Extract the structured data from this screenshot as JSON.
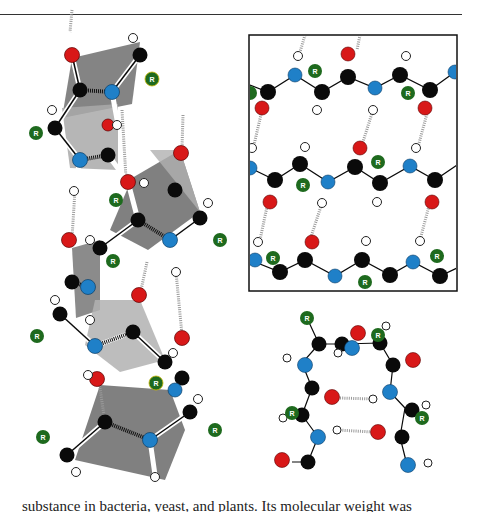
{
  "page": {
    "body_text": "substance in bacteria, yeast, and plants. Its molecular weight was"
  },
  "figure": {
    "panels": [
      {
        "id": "alpha-helix",
        "description": "Alpha-helix polypeptide backbone with shaded peptide planes"
      },
      {
        "id": "beta-sheet",
        "description": "Beta-pleated sheet, three antiparallel strands in a framed box"
      },
      {
        "id": "beta-turn",
        "description": "Beta-turn / hairpin with two hydrogen bonds"
      }
    ],
    "atom_label": "R",
    "colors": {
      "carbon": "#0a0a0a",
      "nitrogen": "#1f80c8",
      "oxygen": "#d81818",
      "hydrogen": "#ffffff",
      "r_group": "#1e6a1e",
      "plane_dark": "#7a7a7a",
      "plane_light": "#b4b4b4",
      "frame": "#111111"
    }
  }
}
